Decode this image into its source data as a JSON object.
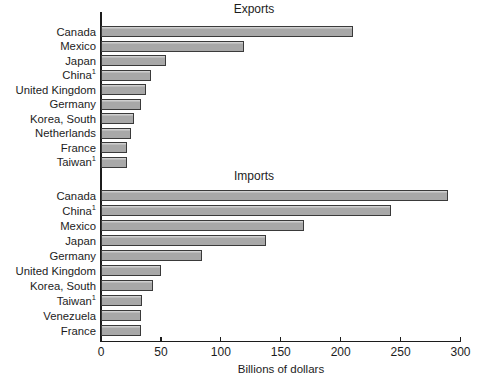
{
  "figure": {
    "xlabel": "Billions of dollars",
    "axis_ticks": [
      0,
      50,
      100,
      150,
      200,
      250,
      300
    ],
    "colors": {
      "background": "#ffffff",
      "bar_fill": "#a8a8a8",
      "bar_border": "#3a3a3a",
      "axis": "#1c1c1c",
      "text": "#1c1c1c"
    }
  },
  "chart_data": [
    {
      "type": "bar",
      "orientation": "horizontal",
      "title": "Exports",
      "xlabel": "Billions of dollars",
      "xlim": [
        0,
        300
      ],
      "categories": [
        "Canada",
        "Mexico",
        "Japan",
        "China",
        "United Kingdom",
        "Germany",
        "Korea, South",
        "Netherlands",
        "France",
        "Taiwan"
      ],
      "footnotes": [
        "",
        "",
        "",
        "1",
        "",
        "",
        "",
        "",
        "",
        "1"
      ],
      "values": [
        211,
        120,
        55,
        42,
        38,
        34,
        28,
        26,
        22,
        22
      ]
    },
    {
      "type": "bar",
      "orientation": "horizontal",
      "title": "Imports",
      "xlabel": "Billions of dollars",
      "xlim": [
        0,
        300
      ],
      "categories": [
        "Canada",
        "China",
        "Mexico",
        "Japan",
        "Germany",
        "United Kingdom",
        "Korea, South",
        "Taiwan",
        "Venezuela",
        "France"
      ],
      "footnotes": [
        "",
        "1",
        "",
        "",
        "",
        "",
        "",
        "1",
        "",
        ""
      ],
      "values": [
        290,
        243,
        170,
        138,
        85,
        51,
        44,
        35,
        34,
        34
      ]
    }
  ]
}
